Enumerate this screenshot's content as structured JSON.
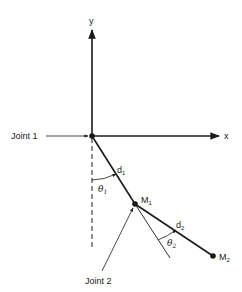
{
  "diagram": {
    "type": "two-link pendulum / robot arm schematic",
    "axes": {
      "x_label": "x",
      "y_label": "y"
    },
    "joints": [
      {
        "label": "Joint 1"
      },
      {
        "label": "Joint 2"
      }
    ],
    "links": [
      {
        "length_label": "d",
        "length_sub": "1",
        "angle_label": "θ",
        "angle_sub": "1"
      },
      {
        "length_label": "d",
        "length_sub": "2",
        "angle_label": "θ",
        "angle_sub": "2"
      }
    ],
    "masses": [
      {
        "label": "M",
        "sub": "1"
      },
      {
        "label": "M",
        "sub": "2"
      }
    ],
    "colors": {
      "stroke": "#1a1a1a",
      "background": "#ffffff"
    }
  }
}
